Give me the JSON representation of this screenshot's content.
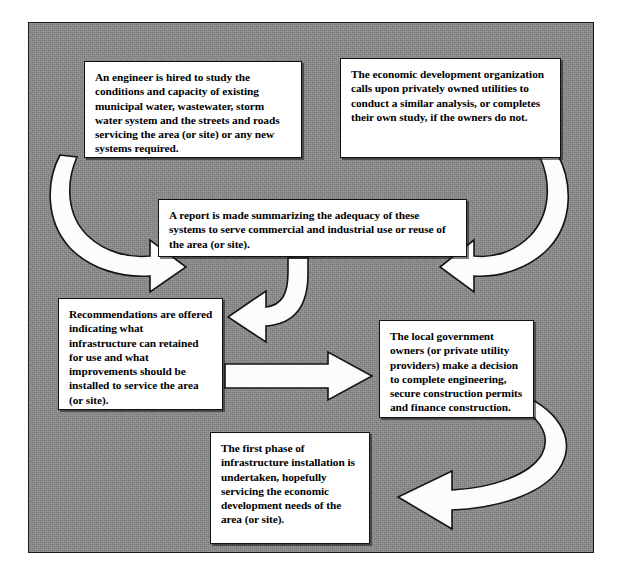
{
  "diagram": {
    "background_color": "#8b8b8b",
    "box_fill_color": "#ffffff",
    "box_border_color": "#111111",
    "arrow_fill_color": "#fcfcfc",
    "arrow_outline_color": "#141414",
    "boxes": [
      {
        "id": "engineer",
        "name": "engineer-study-box",
        "text": "An engineer is hired to study the conditions and capacity of existing municipal water, wastewater, storm water system and the streets and roads servicing the area (or site) or any new systems required."
      },
      {
        "id": "econdev",
        "name": "economic-development-box",
        "text": "The economic development organization calls upon privately owned utilities to conduct a similar analysis, or completes their own study, if the owners do not."
      },
      {
        "id": "report",
        "name": "report-summary-box",
        "text": "A report is made summarizing the adequacy of these systems to serve commercial and industrial use or reuse of the area (or site)."
      },
      {
        "id": "recommend",
        "name": "recommendations-box",
        "text": "Recommendations are offered indicating what infrastructure can retained for use and what improvements should be installed to service the area (or site)."
      },
      {
        "id": "localgov",
        "name": "local-government-box",
        "text": "The local government owners (or private utility providers) make a decision to complete engineering, secure construction permits and finance construction."
      },
      {
        "id": "firstphase",
        "name": "first-phase-box",
        "text": "The first phase of infrastructure installation is undertaken, hopefully servicing the economic development needs of the area (or site)."
      }
    ],
    "arrows": [
      {
        "id": "a1",
        "name": "curved-arrow-engineer-to-report",
        "from": "engineer",
        "to": "report",
        "style": "curved",
        "direction": "down-right"
      },
      {
        "id": "a2",
        "name": "curved-arrow-econdev-to-report",
        "from": "econdev",
        "to": "report",
        "style": "curved",
        "direction": "down-left"
      },
      {
        "id": "a3",
        "name": "curved-arrow-report-to-recommendations",
        "from": "report",
        "to": "recommend",
        "style": "curved",
        "direction": "down-left"
      },
      {
        "id": "a4",
        "name": "straight-arrow-recommendations-to-localgov",
        "from": "recommend",
        "to": "localgov",
        "style": "straight",
        "direction": "right"
      },
      {
        "id": "a5",
        "name": "curved-arrow-localgov-to-firstphase",
        "from": "localgov",
        "to": "firstphase",
        "style": "curved-sweep",
        "direction": "down-left"
      }
    ]
  }
}
